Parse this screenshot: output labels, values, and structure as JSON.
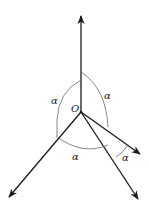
{
  "diagram": {
    "origin_label": "O",
    "angle_labels": [
      {
        "id": "left",
        "text": "α"
      },
      {
        "id": "upper-right",
        "text": "α"
      },
      {
        "id": "bottom",
        "text": "α"
      },
      {
        "id": "lower-right",
        "text": "α"
      }
    ],
    "rays": [
      {
        "id": "up",
        "direction": "up"
      },
      {
        "id": "lower-left",
        "direction": "lower-left"
      },
      {
        "id": "right",
        "direction": "lower-right (shallow)"
      },
      {
        "id": "lower-right",
        "direction": "lower-right (steep)"
      }
    ],
    "colors": {
      "line": "#1a1a1a",
      "arc": "#555555",
      "background": "#ffffff"
    }
  }
}
